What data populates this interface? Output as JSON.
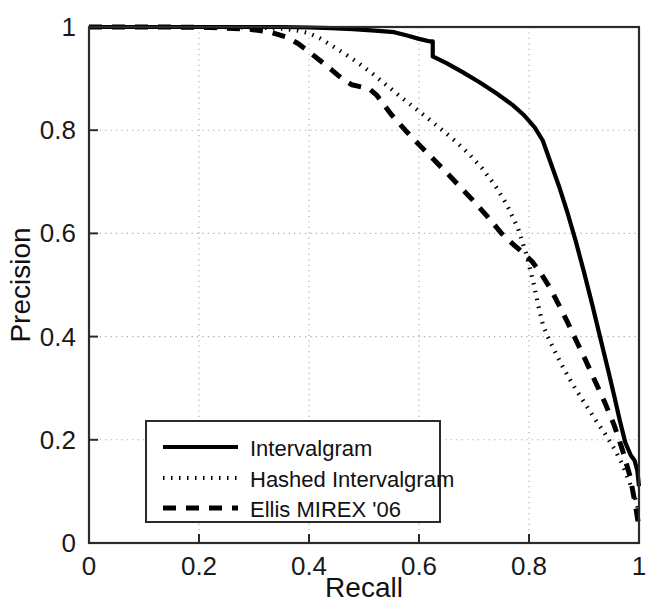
{
  "chart_data": {
    "type": "line",
    "title": "",
    "subtitle": "",
    "xlabel": "Recall",
    "ylabel": "Precision",
    "xlim": [
      0,
      1
    ],
    "ylim": [
      0,
      1
    ],
    "xticks": [
      "0",
      "0.2",
      "0.4",
      "0.6",
      "0.8",
      "1"
    ],
    "xtick_values": [
      0,
      0.2,
      0.4,
      0.6,
      0.8,
      1
    ],
    "yticks": [
      "0",
      "0.2",
      "0.4",
      "0.6",
      "0.8",
      "1"
    ],
    "ytick_values": [
      0,
      0.2,
      0.4,
      0.6,
      0.8,
      1
    ],
    "grid": true,
    "grid_style": "dotted",
    "legend_position": "lower-left",
    "line_color": "#000000",
    "background_color": "#ffffff",
    "axis_color": "#2b2b2b",
    "series": [
      {
        "name": "Intervalgram",
        "style": "solid",
        "x": [
          0.0,
          0.05,
          0.12,
          0.2,
          0.28,
          0.35,
          0.4,
          0.44,
          0.48,
          0.52,
          0.555,
          0.58,
          0.6,
          0.62,
          0.625,
          0.625,
          0.65,
          0.68,
          0.71,
          0.74,
          0.77,
          0.79,
          0.81,
          0.825,
          0.84,
          0.855,
          0.87,
          0.885,
          0.9,
          0.915,
          0.93,
          0.945,
          0.955,
          0.965,
          0.975,
          0.985,
          0.992,
          0.997,
          1.0
        ],
        "y": [
          1.0,
          1.0,
          1.0,
          1.0,
          1.0,
          1.0,
          0.999,
          0.998,
          0.996,
          0.993,
          0.99,
          0.983,
          0.977,
          0.972,
          0.972,
          0.943,
          0.93,
          0.912,
          0.893,
          0.872,
          0.849,
          0.83,
          0.806,
          0.78,
          0.735,
          0.69,
          0.64,
          0.585,
          0.525,
          0.462,
          0.396,
          0.33,
          0.285,
          0.238,
          0.195,
          0.17,
          0.16,
          0.14,
          0.11
        ],
        "endpoint_y": 0.11
      },
      {
        "name": "Hashed Intervalgram",
        "style": "dotted",
        "x": [
          0.0,
          0.06,
          0.14,
          0.22,
          0.3,
          0.35,
          0.38,
          0.4,
          0.42,
          0.44,
          0.465,
          0.49,
          0.515,
          0.54,
          0.565,
          0.59,
          0.615,
          0.64,
          0.665,
          0.69,
          0.715,
          0.74,
          0.76,
          0.78,
          0.795,
          0.808,
          0.818,
          0.826,
          0.834,
          0.844,
          0.856,
          0.87,
          0.886,
          0.903,
          0.92,
          0.938,
          0.955,
          0.97,
          0.982,
          0.992,
          1.0
        ],
        "y": [
          1.0,
          1.0,
          1.0,
          1.0,
          0.999,
          0.997,
          0.993,
          0.988,
          0.978,
          0.965,
          0.948,
          0.93,
          0.91,
          0.888,
          0.866,
          0.845,
          0.824,
          0.802,
          0.78,
          0.755,
          0.726,
          0.69,
          0.655,
          0.61,
          0.56,
          0.505,
          0.455,
          0.42,
          0.4,
          0.378,
          0.352,
          0.325,
          0.296,
          0.268,
          0.24,
          0.212,
          0.183,
          0.152,
          0.12,
          0.09,
          0.06
        ],
        "endpoint_y": 0.06
      },
      {
        "name": "Ellis MIREX '06",
        "style": "dashed",
        "x": [
          0.0,
          0.06,
          0.14,
          0.22,
          0.29,
          0.33,
          0.36,
          0.38,
          0.4,
          0.42,
          0.44,
          0.46,
          0.478,
          0.495,
          0.51,
          0.523,
          0.536,
          0.55,
          0.575,
          0.6,
          0.625,
          0.65,
          0.675,
          0.7,
          0.725,
          0.75,
          0.772,
          0.79,
          0.806,
          0.822,
          0.838,
          0.854,
          0.87,
          0.886,
          0.903,
          0.92,
          0.938,
          0.955,
          0.97,
          0.984,
          0.994,
          1.0
        ],
        "y": [
          1.0,
          1.0,
          1.0,
          0.999,
          0.996,
          0.99,
          0.98,
          0.968,
          0.952,
          0.935,
          0.918,
          0.9,
          0.888,
          0.884,
          0.88,
          0.868,
          0.85,
          0.83,
          0.8,
          0.772,
          0.745,
          0.718,
          0.69,
          0.662,
          0.632,
          0.6,
          0.578,
          0.562,
          0.545,
          0.522,
          0.495,
          0.462,
          0.428,
          0.392,
          0.354,
          0.314,
          0.272,
          0.228,
          0.18,
          0.128,
          0.07,
          0.03
        ],
        "endpoint_y": 0.03
      }
    ],
    "annotations": [
      {
        "kind": "step",
        "series": "Intervalgram",
        "at_x": 0.625,
        "from_y": 0.972,
        "to_y": 0.943
      }
    ]
  },
  "legend": {
    "entries": [
      {
        "label": "Intervalgram",
        "style": "solid"
      },
      {
        "label": "Hashed Intervalgram",
        "style": "dotted"
      },
      {
        "label": "Ellis MIREX '06",
        "style": "dashed"
      }
    ]
  },
  "axes": {
    "x_title": "Recall",
    "y_title": "Precision"
  }
}
